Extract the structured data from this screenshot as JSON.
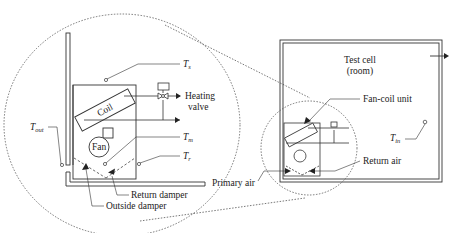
{
  "diagram": {
    "type": "schematic",
    "title": "",
    "detail_view": {
      "labels": {
        "ts": {
          "main": "T",
          "sub": "s"
        },
        "heating_valve_line1": "Heating",
        "heating_valve_line2": "valve",
        "coil": "Coil",
        "fan": "Fan",
        "tout": {
          "main": "T",
          "sub": "out"
        },
        "tm": {
          "main": "T",
          "sub": "m"
        },
        "tr": {
          "main": "T",
          "sub": "r"
        },
        "return_damper": "Return damper",
        "outside_damper": "Outside damper"
      }
    },
    "room_view": {
      "labels": {
        "test_cell_line1": "Test cell",
        "test_cell_line2": "(room)",
        "fan_coil_unit": "Fan-coil unit",
        "tin": {
          "main": "T",
          "sub": "in"
        },
        "return_air": "Return air",
        "primary_air": "Primary air"
      }
    },
    "colors": {
      "stroke": "#333333",
      "text": "#222222",
      "background": "#ffffff"
    }
  }
}
